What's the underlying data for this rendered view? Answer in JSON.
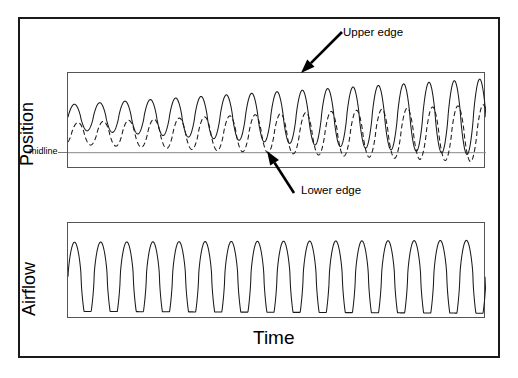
{
  "figure": {
    "background_color": "#ffffff",
    "frame_color": "#1a1a1a",
    "panel_border_color": "#555555",
    "trace_color": "#1a1a1a"
  },
  "labels": {
    "position_axis": "Position",
    "airflow_axis": "Airflow",
    "time_axis": "Time",
    "midline": "midline",
    "upper_edge": "Upper edge",
    "lower_edge": "Lower edge"
  },
  "annotations": [
    {
      "name": "upper-edge-arrow",
      "label": "Upper edge",
      "tail_x": 342,
      "tail_y": 32,
      "tip_x": 301,
      "tip_y": 73,
      "label_x": 343,
      "label_y": 26
    },
    {
      "name": "lower-edge-arrow",
      "label": "Lower edge",
      "tail_x": 294,
      "tail_y": 193,
      "tip_x": 267,
      "tip_y": 151,
      "label_x": 301,
      "label_y": 184
    }
  ],
  "chart_data": {
    "type": "line",
    "title": "",
    "xlabel": "Time",
    "ylabel": "",
    "grid": false,
    "legend": "none",
    "panels": [
      {
        "name": "position",
        "ylabel": "Position",
        "box": {
          "x": 67,
          "y": 72,
          "w": 418,
          "h": 96
        },
        "midline_y_frac": 0.83,
        "series": [
          {
            "name": "Upper edge",
            "style": "solid",
            "cycles": 16.5,
            "phase": 0.0,
            "baseline_frac": 0.46,
            "amplitude_start_frac": 0.13,
            "amplitude_end_frac": 0.4,
            "waveform": "sine-peaked"
          },
          {
            "name": "Lower edge",
            "style": "dashed",
            "cycles": 16.5,
            "phase": 0.14,
            "baseline_frac": 0.63,
            "amplitude_start_frac": 0.11,
            "amplitude_end_frac": 0.3,
            "waveform": "sine-peaked"
          }
        ]
      },
      {
        "name": "airflow",
        "ylabel": "Airflow",
        "box": {
          "x": 67,
          "y": 222,
          "w": 418,
          "h": 96
        },
        "midline_y_frac": null,
        "series": [
          {
            "name": "Airflow",
            "style": "solid",
            "cycles": 16.0,
            "phase": 0.0,
            "baseline_frac": 0.56,
            "amplitude_start_frac": 0.36,
            "amplitude_end_frac": 0.38,
            "waveform": "flat-trough"
          }
        ]
      }
    ]
  }
}
